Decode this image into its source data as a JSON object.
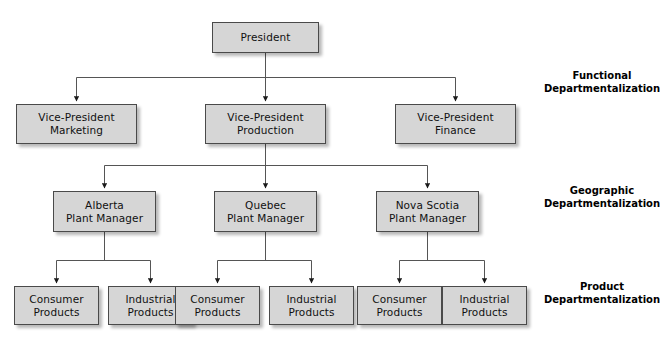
{
  "diagram": {
    "background_color": "#ffffff",
    "box_fill_color": "#d6d6d6",
    "box_border_color": "#4a4a4a",
    "connector_color": "#555555",
    "levels": [
      {
        "id": "level-1",
        "category": "Functional Departmentalization",
        "nodes": [
          {
            "id": "president",
            "label": "President"
          }
        ]
      },
      {
        "id": "level-2",
        "category": "Functional Departmentalization",
        "nodes": [
          {
            "id": "vp-marketing",
            "label": "Vice-President\nMarketing"
          },
          {
            "id": "vp-production",
            "label": "Vice-President\nProduction"
          },
          {
            "id": "vp-finance",
            "label": "Vice-President\nFinance"
          }
        ]
      },
      {
        "id": "level-3",
        "category": "Geographic Departmentalization",
        "nodes": [
          {
            "id": "alberta-plant-manager",
            "label": "Alberta\nPlant Manager"
          },
          {
            "id": "quebec-plant-manager",
            "label": "Quebec\nPlant Manager"
          },
          {
            "id": "nova-scotia-plant-manager",
            "label": "Nova Scotia\nPlant Manager"
          }
        ]
      },
      {
        "id": "level-4",
        "category": "Product Departmentalization",
        "nodes": [
          {
            "id": "alberta-consumer-products",
            "label": "Consumer\nProducts"
          },
          {
            "id": "alberta-industrial-products",
            "label": "Industrial\nProducts"
          },
          {
            "id": "quebec-consumer-products",
            "label": "Consumer\nProducts"
          },
          {
            "id": "quebec-industrial-products",
            "label": "Industrial\nProducts"
          },
          {
            "id": "nova-scotia-consumer-products",
            "label": "Consumer\nProducts"
          },
          {
            "id": "nova-scotia-industrial-products",
            "label": "Industrial\nProducts"
          }
        ]
      }
    ],
    "side_labels": [
      {
        "id": "functional-label",
        "line1": "Functional",
        "line2": "Departmentalization",
        "text": "Functional\nDepartmentalization"
      },
      {
        "id": "geographic-label",
        "line1": "Geographic",
        "line2": "Departmentalization",
        "text": "Geographic\nDepartmentalization"
      },
      {
        "id": "product-label",
        "line1": "Product",
        "line2": "Departmentalization",
        "text": "Product\nDepartmentalization"
      }
    ]
  }
}
